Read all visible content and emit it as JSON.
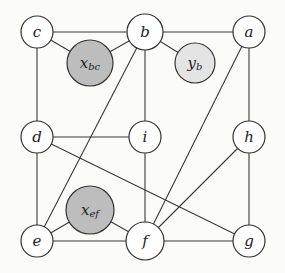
{
  "graph": {
    "nodes": [
      {
        "id": "c",
        "label": "c",
        "x": 37,
        "y": 32,
        "r": 16,
        "fill": "#ffffff"
      },
      {
        "id": "b",
        "label": "b",
        "x": 145,
        "y": 32,
        "r": 18,
        "fill": "#ffffff"
      },
      {
        "id": "a",
        "label": "a",
        "x": 249,
        "y": 32,
        "r": 16,
        "fill": "#ffffff"
      },
      {
        "id": "xbc",
        "label": "x",
        "sub": "bc",
        "x": 90,
        "y": 63,
        "r": 23,
        "fill": "#bdbdbd"
      },
      {
        "id": "yb",
        "label": "y",
        "sub": "b",
        "x": 195,
        "y": 63,
        "r": 20,
        "fill": "#e4e4e4"
      },
      {
        "id": "d",
        "label": "d",
        "x": 37,
        "y": 137,
        "r": 16,
        "fill": "#ffffff"
      },
      {
        "id": "i",
        "label": "i",
        "x": 145,
        "y": 137,
        "r": 16,
        "fill": "#ffffff"
      },
      {
        "id": "h",
        "label": "h",
        "x": 249,
        "y": 137,
        "r": 16,
        "fill": "#ffffff"
      },
      {
        "id": "xef",
        "label": "x",
        "sub": "ef",
        "x": 90,
        "y": 210,
        "r": 24,
        "fill": "#bdbdbd"
      },
      {
        "id": "e",
        "label": "e",
        "x": 37,
        "y": 241,
        "r": 16,
        "fill": "#ffffff"
      },
      {
        "id": "f",
        "label": "f",
        "x": 145,
        "y": 241,
        "r": 19,
        "fill": "#ffffff"
      },
      {
        "id": "g",
        "label": "g",
        "x": 249,
        "y": 241,
        "r": 16,
        "fill": "#ffffff"
      }
    ],
    "edges": [
      [
        "c",
        "b"
      ],
      [
        "b",
        "a"
      ],
      [
        "c",
        "xbc"
      ],
      [
        "xbc",
        "b"
      ],
      [
        "b",
        "yb"
      ],
      [
        "c",
        "d"
      ],
      [
        "b",
        "i"
      ],
      [
        "a",
        "h"
      ],
      [
        "b",
        "e"
      ],
      [
        "a",
        "f"
      ],
      [
        "d",
        "i"
      ],
      [
        "d",
        "g"
      ],
      [
        "d",
        "e"
      ],
      [
        "i",
        "f"
      ],
      [
        "h",
        "f"
      ],
      [
        "h",
        "g"
      ],
      [
        "e",
        "xef"
      ],
      [
        "xef",
        "f"
      ],
      [
        "e",
        "f"
      ],
      [
        "f",
        "g"
      ]
    ]
  }
}
